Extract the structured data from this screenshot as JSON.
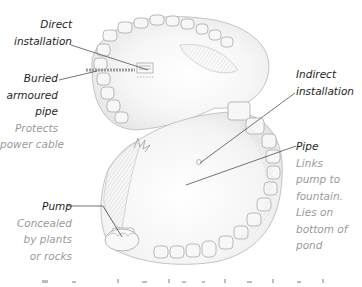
{
  "diagram": {
    "colors": {
      "background": "#ffffff",
      "label_title": "#1e1e1e",
      "label_description": "#9a9a9a",
      "leader_line": "#3a3a3a",
      "sketch_stroke": "#b0b0b0",
      "sketch_fill": "#f2f2f2"
    },
    "callouts": [
      {
        "id": "direct-installation",
        "title_lines": [
          "Direct",
          "installation"
        ],
        "description_lines": []
      },
      {
        "id": "buried-armoured-pipe",
        "title_lines": [
          "Buried",
          "armoured",
          "pipe"
        ],
        "description_lines": [
          "Protects",
          "power cable"
        ]
      },
      {
        "id": "indirect-installation",
        "title_lines": [
          "Indirect",
          "installation"
        ],
        "description_lines": []
      },
      {
        "id": "pipe",
        "title_lines": [
          "Pipe"
        ],
        "description_lines": [
          "Links",
          "pump to",
          "fountain.",
          "Lies on",
          "bottom of",
          "pond"
        ]
      },
      {
        "id": "pump",
        "title_lines": [
          "Pump"
        ],
        "description_lines": [
          "Concealed",
          "by plants",
          "or rocks"
        ]
      }
    ],
    "caption_partial": "(text cut off at bottom edge)"
  }
}
